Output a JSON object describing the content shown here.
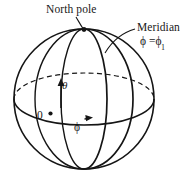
{
  "figure": {
    "kind": "spherical-coordinates-diagram",
    "background_color": "#ffffff",
    "ink_color": "#151515",
    "labels": {
      "north_pole": "North pole",
      "meridian": "Meridian",
      "meridian_equation_phi": "ϕ =",
      "meridian_equation_phi1": "ϕ",
      "meridian_equation_sub": "1",
      "theta": "θ",
      "origin": "0",
      "phi": "ϕ"
    },
    "geometry": {
      "sphere_center_x": 84,
      "sphere_center_y": 99,
      "sphere_radius": 70,
      "north_pole_x": 84,
      "north_pole_y": 29,
      "south_pole_x": 84,
      "south_pole_y": 169,
      "equator_ry": 26,
      "front_meridian_rx": 23,
      "phi1_meridian_rx": 49,
      "origin_point_x": 49,
      "origin_point_y": 114
    }
  }
}
